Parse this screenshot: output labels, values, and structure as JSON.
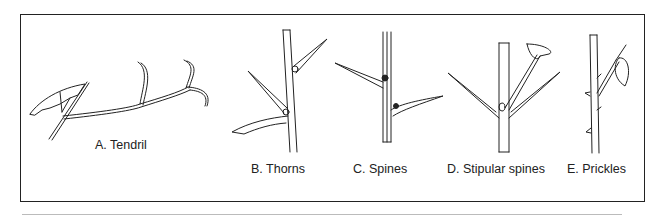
{
  "figure": {
    "panels": [
      {
        "id": "A",
        "label": "A. Tendril"
      },
      {
        "id": "B",
        "label": "B. Thorns"
      },
      {
        "id": "C",
        "label": "C. Spines"
      },
      {
        "id": "D",
        "label": "D. Stipular spines"
      },
      {
        "id": "E",
        "label": "E. Prickles"
      }
    ]
  }
}
